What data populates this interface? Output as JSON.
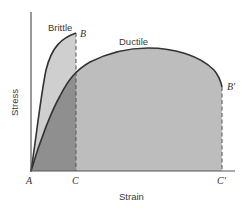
{
  "diagram": {
    "axes": {
      "x_label": "Strain",
      "y_label": "Stress"
    },
    "curves": [
      {
        "name": "Brittle",
        "label": "Brittle",
        "end_point_label": "B",
        "strain_at_fracture_label": "C"
      },
      {
        "name": "Ductile",
        "label": "Ductile",
        "end_point_label": "B'",
        "strain_at_fracture_label": "C'"
      }
    ],
    "points": {
      "origin": "A",
      "brittle_fracture": "B",
      "brittle_strain": "C",
      "ductile_fracture": "B'",
      "ductile_strain": "C'"
    },
    "colors": {
      "axis": "#555555",
      "curve": "#333333",
      "ductile_fill": "#bdbdbd",
      "brittle_fill": "#cfcfcf",
      "overlap_fill": "#8f8f8f",
      "dashed": "#555555"
    }
  }
}
